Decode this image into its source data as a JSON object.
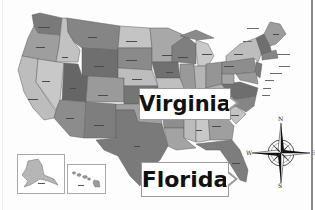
{
  "map": {
    "title": "United States Map",
    "style": "grayscale political map with state labels",
    "callouts": [
      {
        "label": "Virginia",
        "pointer": "right"
      },
      {
        "label": "Florida",
        "pointer": "right"
      }
    ],
    "insets": [
      {
        "name": "Alaska",
        "label": "Alaska"
      },
      {
        "name": "Hawaii",
        "label": "Hawaii"
      }
    ],
    "compass": {
      "n": "N",
      "s": "S",
      "e": "E",
      "w": "W",
      "ne": "NE",
      "nw": "NW",
      "se": "SE",
      "sw": "SW"
    },
    "northeast_labels": [
      "New Hampshire",
      "Vermont",
      "Massachusetts",
      "Rhode Island",
      "Connecticut",
      "New Jersey",
      "Delaware",
      "Maryland"
    ],
    "colors": {
      "dark": "#6f6f6f",
      "medium_dark": "#858585",
      "medium": "#9b9b9b",
      "light": "#b8b8b8",
      "lightest": "#cfcfcf",
      "border": "#5a5a5a",
      "callout_border": "#9a9a9a"
    }
  }
}
